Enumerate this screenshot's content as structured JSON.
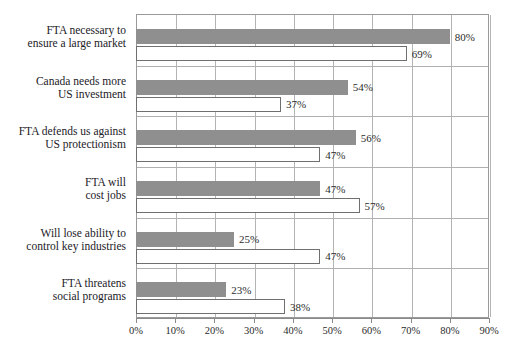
{
  "chart_data": {
    "type": "bar",
    "orientation": "horizontal",
    "title": "",
    "xlabel": "",
    "ylabel": "",
    "xlim": [
      0,
      90
    ],
    "xtick_labels": [
      "0%",
      "10%",
      "20%",
      "30%",
      "40%",
      "50%",
      "60%",
      "70%",
      "80%",
      "90%"
    ],
    "xticks": [
      0,
      10,
      20,
      30,
      40,
      50,
      60,
      70,
      80,
      90
    ],
    "grid": true,
    "legend": "none",
    "categories": [
      "FTA necessary to ensure a large market",
      "Canada needs more US investment",
      "FTA defends us against US protectionism",
      "FTA will cost jobs",
      "Will lose ability to control key industries",
      "FTA threatens social programs"
    ],
    "category_lines": [
      [
        "FTA necessary to",
        "ensure a large market"
      ],
      [
        "Canada needs more",
        "US investment"
      ],
      [
        "FTA defends us against",
        "US protectionism"
      ],
      [
        "FTA will",
        "cost jobs"
      ],
      [
        "Will lose ability to",
        "control key industries"
      ],
      [
        "FTA threatens",
        "social programs"
      ]
    ],
    "series": [
      {
        "name": "series-gray",
        "color": "#8f8f8f",
        "values": [
          80,
          54,
          56,
          47,
          25,
          23
        ],
        "labels": [
          "80%",
          "54%",
          "56%",
          "47%",
          "25%",
          "23%"
        ]
      },
      {
        "name": "series-white",
        "color": "#ffffff",
        "values": [
          69,
          37,
          47,
          57,
          47,
          38
        ],
        "labels": [
          "69%",
          "37%",
          "47%",
          "57%",
          "47%",
          "38%"
        ]
      }
    ]
  },
  "colors": {
    "bar_gray": "#8f8f8f",
    "bar_white": "#ffffff",
    "bar_white_border": "#6f6f6f",
    "gridline": "#b4b4b4",
    "axis": "#8a8a8a",
    "text": "#2b2b2b"
  }
}
